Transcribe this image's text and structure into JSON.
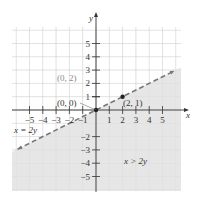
{
  "chart_data": {
    "type": "line",
    "title": "",
    "xlabel": "x",
    "ylabel": "y",
    "xlim": [
      -6,
      6
    ],
    "ylim": [
      -6,
      6
    ],
    "grid": true,
    "x_ticks": [
      "-5",
      "-4",
      "-3",
      "-2",
      "-1",
      "1",
      "2",
      "3",
      "4",
      "5"
    ],
    "y_ticks": [
      "5",
      "4",
      "3",
      "2",
      "1",
      "-2",
      "-3",
      "-4",
      "-5"
    ],
    "boundary_line": {
      "equation": "x = 2y",
      "style": "dashed",
      "points": [
        [
          -6,
          -3
        ],
        [
          6,
          3
        ]
      ]
    },
    "shaded_region": {
      "inequality": "x > 2y",
      "side": "below line"
    },
    "annotations": [
      {
        "text": "(0, 2)",
        "x": 0,
        "y": 2,
        "note": "test point label"
      },
      {
        "text": "(0, 0)",
        "x": 0,
        "y": 0
      },
      {
        "text": "(2, 1)",
        "x": 2,
        "y": 1
      },
      {
        "text": "x = 2y",
        "position": "left, near line"
      },
      {
        "text": "x > 2y",
        "position": "lower right region"
      }
    ],
    "points": [
      [
        0,
        0
      ],
      [
        2,
        1
      ]
    ]
  },
  "labels": {
    "x_axis": "x",
    "y_axis": "y",
    "pt_0_2": "(0, 2)",
    "pt_0_0": "(0, 0)",
    "pt_2_1": "(2, 1)",
    "line_eq": "x = 2y",
    "region": "x > 2y"
  },
  "colors": {
    "shade": "#e6e6e6",
    "grid": "#d8d8d8",
    "axis": "#333333",
    "line": "#777777",
    "gray_label": "#8a8a8a"
  }
}
